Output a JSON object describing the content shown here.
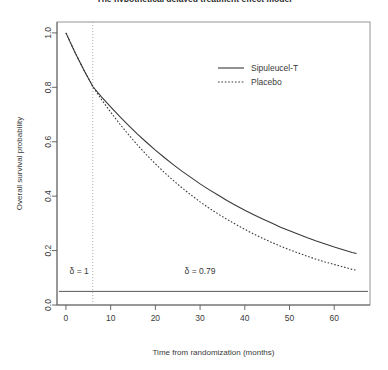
{
  "chart_data": {
    "type": "line",
    "title": "The hypothetical delayed treatment effect model",
    "xlabel": "Time from randomization (months)",
    "ylabel": "Overall survival probability",
    "xlim": [
      -2,
      68
    ],
    "ylim": [
      0.0,
      1.04
    ],
    "xticks": [
      0,
      10,
      20,
      30,
      40,
      50,
      60
    ],
    "yticks": [
      "0.0",
      "0.2",
      "0.4",
      "0.6",
      "0.8",
      "1.0"
    ],
    "ytick_values": [
      0.0,
      0.2,
      0.4,
      0.6,
      0.8,
      1.0
    ],
    "grid": false,
    "legend_position": "top-right",
    "x": [
      0,
      2,
      4,
      6,
      8,
      10,
      12,
      14,
      16,
      18,
      20,
      22,
      24,
      26,
      28,
      30,
      32,
      34,
      36,
      38,
      40,
      42,
      44,
      46,
      48,
      50,
      52,
      54,
      56,
      58,
      60,
      62,
      64,
      65
    ],
    "series": [
      {
        "name": "Sipuleucel-T",
        "style": "solid",
        "color": "#3a3a3a",
        "values": [
          1.0,
          0.929,
          0.864,
          0.803,
          0.764,
          0.728,
          0.693,
          0.66,
          0.628,
          0.598,
          0.569,
          0.542,
          0.516,
          0.491,
          0.468,
          0.445,
          0.424,
          0.404,
          0.384,
          0.366,
          0.348,
          0.332,
          0.316,
          0.301,
          0.286,
          0.273,
          0.26,
          0.247,
          0.235,
          0.224,
          0.213,
          0.203,
          0.193,
          0.189
        ]
      },
      {
        "name": "Placebo",
        "style": "dotted",
        "color": "#3a3a3a",
        "values": [
          1.0,
          0.929,
          0.864,
          0.803,
          0.754,
          0.709,
          0.666,
          0.626,
          0.588,
          0.552,
          0.519,
          0.487,
          0.458,
          0.43,
          0.404,
          0.379,
          0.356,
          0.335,
          0.315,
          0.296,
          0.278,
          0.261,
          0.245,
          0.23,
          0.216,
          0.203,
          0.191,
          0.179,
          0.168,
          0.158,
          0.149,
          0.14,
          0.131,
          0.128
        ]
      }
    ],
    "reference_line_vertical": {
      "x": 6,
      "style": "dotted"
    },
    "reference_line_horizontal": {
      "y": 0.05,
      "style": "solid"
    },
    "annotations": [
      {
        "text": "δ = 1",
        "x": 6,
        "y": 0.115,
        "align": "right"
      },
      {
        "text": "δ = 0.79",
        "x": 30,
        "y": 0.115,
        "align": "center"
      }
    ]
  }
}
